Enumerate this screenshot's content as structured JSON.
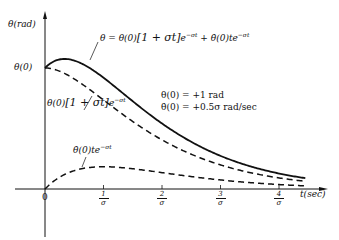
{
  "chart_data": {
    "type": "line",
    "title": "",
    "xlabel": "t(sec)",
    "ylabel": "θ(rad)",
    "x_ticks": [
      "0",
      "1/σ",
      "2/σ",
      "3/σ",
      "4/σ"
    ],
    "y_ticks": [
      "θ(0)"
    ],
    "x_units": "multiples of 1/σ",
    "x": [
      0,
      0.25,
      0.5,
      0.75,
      1.0,
      1.5,
      2.0,
      2.5,
      3.0,
      3.5,
      4.0,
      4.5
    ],
    "series": [
      {
        "name": "θ = θ(0)[1 + σt]e^{-σt} + θ̇(0)te^{-σt}",
        "style": "solid",
        "values": [
          1.0,
          1.071,
          1.061,
          1.011,
          0.92,
          0.781,
          0.541,
          0.369,
          0.249,
          0.166,
          0.11,
          0.072
        ]
      },
      {
        "name": "θ(0)[1 + σt]e^{-σt}",
        "style": "dashed",
        "values": [
          1.0,
          0.974,
          0.91,
          0.827,
          0.736,
          0.558,
          0.406,
          0.287,
          0.199,
          0.136,
          0.092,
          0.061
        ]
      },
      {
        "name": "θ̇(0)te^{-σt}",
        "style": "dashed",
        "values": [
          0.0,
          0.097,
          0.152,
          0.177,
          0.184,
          0.167,
          0.135,
          0.103,
          0.075,
          0.053,
          0.037,
          0.025
        ]
      }
    ],
    "annotations": [
      "θ(0) = +1 rad",
      "θ̇(0) = +0.5σ rad/sec"
    ],
    "legend": "none (inline labels with leader lines)",
    "grid": false
  },
  "labels": {
    "ylabel": "θ(rad)",
    "xlabel": "t(sec)",
    "theta0_tick": "θ(0)",
    "origin": "0",
    "tick_num": [
      "1",
      "2",
      "3",
      "4"
    ],
    "tick_den": "σ",
    "curve_total_lhs": "θ = θ(0)",
    "curve_total_mid": "[1 + σt]",
    "curve_total_e1": "e",
    "curve_total_exp1": "−σt",
    "curve_total_plus": " + θ̇(0)te",
    "curve_total_exp2": "−σt",
    "curve_init_a": "θ(0)",
    "curve_init_b": "[1 + σt]",
    "curve_init_e": "e",
    "curve_init_exp": "−σt",
    "curve_vel_a": "θ̇(0)te",
    "curve_vel_exp": "−σt",
    "cond1": "θ(0)  =  +1 rad",
    "cond2": "θ̇(0)  =  +0.5σ  rad/sec"
  }
}
